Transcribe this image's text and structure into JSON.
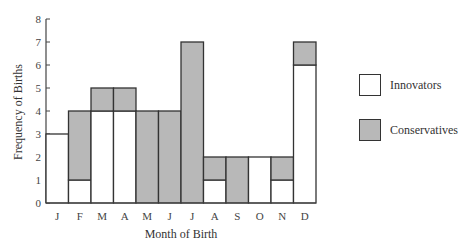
{
  "chart_data": {
    "type": "bar",
    "stacked": true,
    "title": "",
    "xlabel": "Month of Birth",
    "ylabel": "Frequency of Births",
    "categories": [
      "J",
      "F",
      "M",
      "A",
      "M",
      "J",
      "J",
      "A",
      "S",
      "O",
      "N",
      "D"
    ],
    "series": [
      {
        "name": "Innovators",
        "color": "#ffffff",
        "values": [
          3,
          1,
          4,
          4,
          0,
          0,
          0,
          1,
          0,
          2,
          1,
          6
        ]
      },
      {
        "name": "Conservatives",
        "color": "#b8b8b8",
        "values": [
          0,
          3,
          1,
          1,
          4,
          4,
          7,
          1,
          2,
          0,
          1,
          1
        ]
      }
    ],
    "yticks": [
      0,
      1,
      2,
      3,
      4,
      5,
      6,
      7,
      8
    ],
    "ylim": [
      0,
      8
    ],
    "grid": false,
    "legend_position": "right"
  },
  "legend": {
    "items": [
      {
        "label": "Innovators",
        "color": "#ffffff"
      },
      {
        "label": "Conservatives",
        "color": "#b8b8b8"
      }
    ]
  }
}
